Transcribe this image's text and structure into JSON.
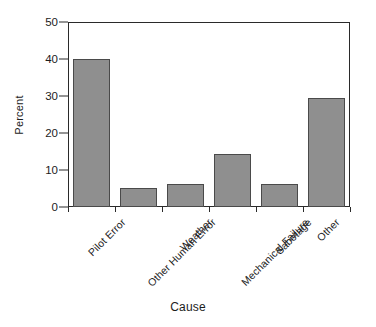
{
  "chart_data": {
    "type": "bar",
    "title": "",
    "xlabel": "Cause",
    "ylabel": "Percent",
    "categories": [
      "Pilot Error",
      "Other Human Error",
      "Weather",
      "Mechanical Failure",
      "Sabotage",
      "Other"
    ],
    "values": [
      40,
      5.2,
      6.2,
      14.2,
      6.3,
      29.5
    ],
    "ylim": [
      0,
      50
    ],
    "yticks": [
      0,
      10,
      20,
      30,
      40,
      50
    ],
    "ytick_labels": [
      "0",
      "10",
      "20",
      "30",
      "40",
      "50"
    ],
    "grid": false,
    "legend": null,
    "bar_color": "#8f8f8f",
    "bar_edge_color": "#4a4a4a",
    "axis_color": "#2a2a2a",
    "background": "#ffffff"
  }
}
